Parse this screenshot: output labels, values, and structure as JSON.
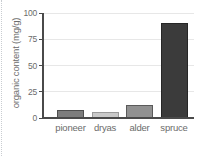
{
  "chart_data": {
    "type": "bar",
    "title": "",
    "xlabel": "",
    "ylabel": "organic content (mg/g)",
    "categories": [
      "pioneer",
      "dryas",
      "alder",
      "spruce"
    ],
    "values": [
      8,
      6,
      12,
      90
    ],
    "ylim": [
      0,
      100
    ],
    "yticks": [
      0,
      25,
      50,
      75,
      100
    ],
    "grid": "horizontal-light",
    "legend": "none",
    "bar_fill_colors": [
      "#7d7d7d",
      "#c9c9c9",
      "#919191",
      "#3b3b3b"
    ],
    "bar_border_colors": [
      "#4f4f4f",
      "#9a9a9a",
      "#5a5a5a",
      "#262626"
    ],
    "axis_color": "#4a4a4a",
    "grid_color": "#e7e7e7",
    "text_color": "#6b6b6b"
  }
}
